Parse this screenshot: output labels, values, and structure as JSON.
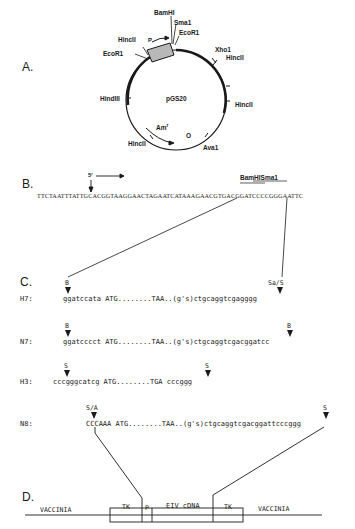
{
  "panels": {
    "A": {
      "label": "A.",
      "plasmid_name": "pGS20",
      "sites": {
        "bamhi": "BamHI",
        "sma1": "Sma1",
        "ecor1_right": "EcoR1",
        "hincii_top": "HincII",
        "ecor1_left": "EcoR1",
        "xho1": "Xho1",
        "hincii_right_upper": "HincII",
        "hindiii": "HindIII",
        "hincii_right_lower": "HincII",
        "hincii_bottom": "HincII",
        "ava1": "Ava1"
      },
      "promoter_label": "P",
      "amp_label": "Am",
      "amp_superscript": "r",
      "origin_label": "O"
    },
    "B": {
      "label": "B.",
      "five_prime": "5'",
      "sequence": "TTCTAATTTATTGCACGGTAAGGAACTAGAATCATAAAGAACGTGACGGATCCCCGGGAATTC",
      "site_label": "BamHISma1"
    },
    "C": {
      "label": "C.",
      "rows": [
        {
          "name": "H7:",
          "seq": "ggatccata ATG........TAA..(g's)ctgcaggtcgagggg",
          "left_site": "B",
          "right_site": "Sa/S"
        },
        {
          "name": "N7:",
          "seq": "ggatcccct ATG........TAA..(g's)ctgcaggtcgacggatcc",
          "left_site": "B",
          "right_site": "B"
        },
        {
          "name": "H3:",
          "seq": "cccgggcatcg ATG........TGA cccggg",
          "left_site": "S",
          "right_site": "S"
        },
        {
          "name": "N8:",
          "seq": "CCCAAA ATG........TAA..(g's)ctgcaggtcgacggattcccggg",
          "left_site": "S/A",
          "right_site": "S"
        }
      ]
    },
    "D": {
      "label": "D.",
      "left_flank": "VACCINIA",
      "right_flank": "VACCINIA",
      "tk_left": "TK",
      "promoter": "P",
      "insert": "EIV cDNA",
      "tk_right": "TK"
    }
  }
}
